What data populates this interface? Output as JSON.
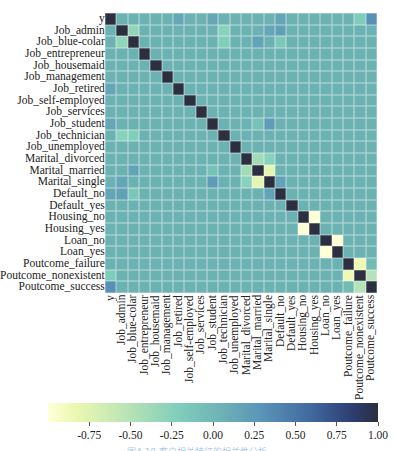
{
  "chart_data": {
    "type": "heatmap",
    "title": "",
    "xlabel": "",
    "ylabel": "",
    "labels": [
      "y",
      "Job_admin",
      "Job_blue-colar",
      "Job_entrepreneur",
      "Job_housemaid",
      "Job_management",
      "Job_retired",
      "Job_self-employed",
      "Job_services",
      "Job_student",
      "Job_technician",
      "Job_unemployed",
      "Marital_divorced",
      "Marital_married",
      "Marital_single",
      "Default_no",
      "Default_yes",
      "Housing_no",
      "Housing_yes",
      "Loan_no",
      "Loan_yes",
      "Poutcome_failure",
      "Poutcome_nonexistent",
      "Poutcome_success"
    ],
    "colorbar": {
      "range": [
        -1.0,
        1.0
      ],
      "ticks": [
        -0.75,
        -0.5,
        -0.25,
        0.0,
        0.25,
        0.5,
        0.75,
        1.0
      ],
      "tick_labels": [
        "-0.75",
        "-0.50",
        "-0.25",
        "0.00",
        "0.25",
        "0.50",
        "0.75",
        "1.00"
      ],
      "colormap": "YlGnBu-like (light yellow = -1, dark navy = 1)"
    },
    "notable_correlations": [
      {
        "a": "y",
        "b": "Poutcome_success",
        "value": 0.32
      },
      {
        "a": "y",
        "b": "Poutcome_nonexistent",
        "value": -0.19
      },
      {
        "a": "y",
        "b": "Job_retired",
        "value": 0.09
      },
      {
        "a": "y",
        "b": "Job_student",
        "value": 0.09
      },
      {
        "a": "y",
        "b": "Default_no",
        "value": 0.1
      },
      {
        "a": "Job_admin",
        "b": "Job_blue-colar",
        "value": -0.31
      },
      {
        "a": "Job_admin",
        "b": "Job_technician",
        "value": -0.25
      },
      {
        "a": "Job_blue-colar",
        "b": "Job_technician",
        "value": -0.21
      },
      {
        "a": "Job_admin",
        "b": "Marital_single",
        "value": 0.1
      },
      {
        "a": "Job_blue-colar",
        "b": "Marital_married",
        "value": 0.12
      },
      {
        "a": "Job_student",
        "b": "Marital_single",
        "value": 0.2
      },
      {
        "a": "Job_student",
        "b": "Marital_married",
        "value": -0.12
      },
      {
        "a": "Job_admin",
        "b": "Default_no",
        "value": 0.14
      },
      {
        "a": "Job_blue-colar",
        "b": "Default_no",
        "value": -0.16
      },
      {
        "a": "Marital_divorced",
        "b": "Marital_married",
        "value": -0.4
      },
      {
        "a": "Marital_divorced",
        "b": "Marital_single",
        "value": -0.25
      },
      {
        "a": "Marital_married",
        "b": "Marital_single",
        "value": -0.78
      },
      {
        "a": "Marital_single",
        "b": "Default_no",
        "value": 0.12
      },
      {
        "a": "Default_no",
        "b": "Default_yes",
        "value": 0.0
      },
      {
        "a": "Housing_no",
        "b": "Housing_yes",
        "value": -0.98
      },
      {
        "a": "Loan_no",
        "b": "Loan_yes",
        "value": -0.98
      },
      {
        "a": "Poutcome_failure",
        "b": "Poutcome_nonexistent",
        "value": -0.86
      },
      {
        "a": "Poutcome_failure",
        "b": "Poutcome_success",
        "value": -0.07
      },
      {
        "a": "Poutcome_nonexistent",
        "b": "Poutcome_success",
        "value": -0.5
      }
    ],
    "diagonal_value": 1.0,
    "baseline_value": 0.0
  },
  "caption": "图4.18  客户相关特征的相关性分析"
}
